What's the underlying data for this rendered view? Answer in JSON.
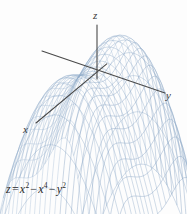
{
  "figure": {
    "caption_equation": "z = x^2 - x^4 - y^2",
    "background_color": "#fdfdfd",
    "width": 187,
    "height": 214
  },
  "equation": {
    "lhs": "z",
    "equals": "=",
    "term1_base": "x",
    "term1_exp": "2",
    "minus1": "−",
    "term2_base": "x",
    "term2_exp": "4",
    "minus2": "−",
    "term3_base": "y",
    "term3_exp": "2"
  },
  "axes": {
    "color": "#4a4a4a",
    "x_label": "x",
    "y_label": "y",
    "z_label": "z",
    "origin": {
      "x": 97,
      "y": 72
    },
    "x_axis_end": {
      "x": 36,
      "y": 123
    },
    "y_axis_end": {
      "x": 165,
      "y": 93
    },
    "y_axis_start": {
      "x": 42,
      "y": 51
    },
    "z_axis_top": {
      "x": 97,
      "y": 25
    }
  },
  "surface": {
    "mesh_color": "#8fa9c7",
    "mesh_color_light": "#b3c6dd",
    "style": "wireframe"
  },
  "chart_data": {
    "type": "surface",
    "title": "",
    "equation": "z = x^2 - x^4 - y^2",
    "xlabel": "x",
    "ylabel": "y",
    "zlabel": "z",
    "xlim": [
      -1.45,
      1.45
    ],
    "ylim": [
      -1.45,
      1.45
    ],
    "zlim": [
      -2.3,
      0.26
    ],
    "grid": false,
    "legend": false,
    "mesh_u_lines": 24,
    "mesh_v_lines": 24,
    "critical_points": [
      {
        "x": -0.7071,
        "y": 0,
        "z": 0.25,
        "kind": "local maximum"
      },
      {
        "x": 0.7071,
        "y": 0,
        "z": 0.25,
        "kind": "local maximum"
      },
      {
        "x": 0,
        "y": 0,
        "z": 0,
        "kind": "saddle point"
      }
    ],
    "projection": {
      "type": "axonometric",
      "x_axis_screen_vector": [
        -0.78,
        0.65
      ],
      "y_axis_screen_vector": [
        0.95,
        0.31
      ],
      "z_axis_screen_vector": [
        0,
        -1
      ],
      "scale_x": 44,
      "scale_y": 44,
      "scale_z": 58
    }
  }
}
